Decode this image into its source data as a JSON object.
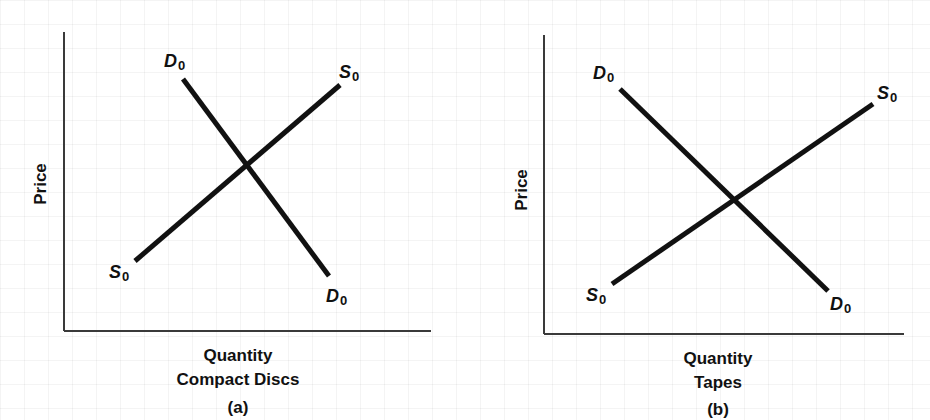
{
  "panels": [
    {
      "id": "a",
      "tag": "(a)",
      "ylabel": "Price",
      "xlabel_line1": "Quantity",
      "xlabel_line2": "Compact Discs",
      "axes": {
        "origin": [
          64,
          331
        ],
        "y_top": 32,
        "x_right": 431
      },
      "demand": {
        "label": "D",
        "sub": "0",
        "from": [
          183,
          79
        ],
        "to": [
          329,
          276
        ],
        "label_top": [
          164,
          67
        ],
        "label_bottom": [
          326,
          302
        ]
      },
      "supply": {
        "label": "S",
        "sub": "0",
        "from": [
          135,
          261
        ],
        "to": [
          340,
          85
        ],
        "label_top": [
          339,
          78
        ],
        "label_bottom": [
          109,
          278
        ]
      }
    },
    {
      "id": "b",
      "tag": "(b)",
      "ylabel": "Price",
      "xlabel_line1": "Quantity",
      "xlabel_line2": "Tapes",
      "axes": {
        "origin": [
          544,
          334
        ],
        "y_top": 35,
        "x_right": 904
      },
      "demand": {
        "label": "D",
        "sub": "0",
        "from": [
          620,
          89
        ],
        "to": [
          828,
          291
        ],
        "label_top": [
          593,
          79
        ],
        "label_bottom": [
          830,
          310
        ]
      },
      "supply": {
        "label": "S",
        "sub": "0",
        "from": [
          612,
          284
        ],
        "to": [
          873,
          104
        ],
        "label_top": [
          877,
          99
        ],
        "label_bottom": [
          586,
          301
        ]
      }
    }
  ],
  "labels": {
    "a_tag": "(a)",
    "b_tag": "(b)",
    "price": "Price",
    "quantity": "Quantity",
    "compact_discs": "Compact Discs",
    "tapes": "Tapes",
    "d": "D",
    "s": "S",
    "zero": "0"
  },
  "colors": {
    "line": "#111111",
    "axis": "#3a3a3a",
    "grid": "#e9e9e9",
    "background": "#ffffff"
  }
}
